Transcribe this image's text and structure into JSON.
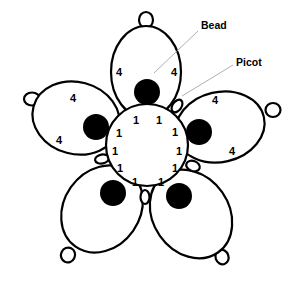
{
  "diagram": {
    "labels": {
      "bead": "Bead",
      "picot": "Picot"
    },
    "petal_counts": {
      "top": [
        "4",
        "4"
      ],
      "left": [
        "4",
        "4"
      ],
      "right": [
        "4",
        "4"
      ],
      "bottom_left": [],
      "bottom_right": []
    },
    "center_ring_counts": [
      "1",
      "1",
      "1",
      "1",
      "1",
      "1",
      "1",
      "1",
      "1",
      "1",
      "1",
      "1"
    ],
    "colors": {
      "line": "#000000",
      "bead": "#000000",
      "leader": "#9a9a9a",
      "background": "#ffffff"
    }
  }
}
